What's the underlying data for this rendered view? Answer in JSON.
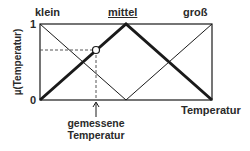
{
  "diagram": {
    "type": "fuzzy-membership-functions",
    "sets": [
      {
        "key": "klein",
        "label": "klein",
        "underlined": false,
        "emphasized": false,
        "points": [
          [
            0,
            1
          ],
          [
            0.5,
            0
          ]
        ]
      },
      {
        "key": "mittel",
        "label": "mittel",
        "underlined": true,
        "emphasized": true,
        "points": [
          [
            0,
            0
          ],
          [
            0.5,
            1
          ],
          [
            1,
            0
          ]
        ]
      },
      {
        "key": "gross",
        "label": "groß",
        "underlined": false,
        "emphasized": false,
        "points": [
          [
            0.5,
            0
          ],
          [
            1,
            1
          ]
        ]
      }
    ],
    "y_axis": {
      "label": "µ(Temperatur)",
      "tick_top": "1",
      "tick_bottom": "0"
    },
    "x_axis": {
      "label": "Temperatur"
    },
    "measured_value": {
      "label_line1": "gemessene",
      "label_line2": "Temperatur",
      "x_fraction": 0.326,
      "membership": 0.66
    },
    "colors": {
      "line": "#1a1a1a",
      "dashed": "#555555",
      "text": "#2a2a2a",
      "marker_fill": "#ffffff"
    }
  }
}
